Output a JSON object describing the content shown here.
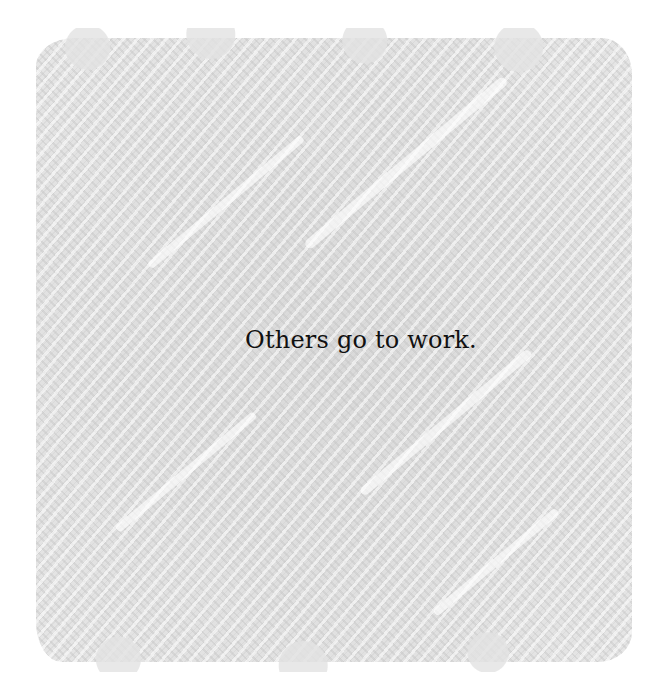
{
  "illustration": {
    "background": "gray pencil scribble texture",
    "colors": {
      "page": "#ffffff",
      "scribble": "#dcdcdc",
      "text": "#111111"
    }
  },
  "caption": {
    "text": "Others go to work."
  }
}
